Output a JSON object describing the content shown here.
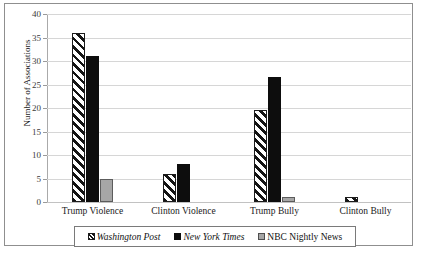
{
  "chart_data": {
    "type": "bar",
    "title": "",
    "xlabel": "",
    "ylabel": "Number of Associations",
    "ylim": [
      0,
      40
    ],
    "yticks": [
      0,
      5,
      10,
      15,
      20,
      25,
      30,
      35,
      40
    ],
    "ytick_labels": [
      "0",
      "5",
      "10",
      "15",
      "20",
      "25",
      "30",
      "35",
      "40"
    ],
    "grid": true,
    "legend_position": "bottom",
    "categories": [
      "Trump Violence",
      "Clinton Violence",
      "Trump Bully",
      "Clinton Bully"
    ],
    "series": [
      {
        "name": "Washington Post",
        "style": "diagonal-hatch",
        "color": "#ffffff",
        "italic": true,
        "values": [
          36,
          6,
          19.5,
          1
        ]
      },
      {
        "name": "New York Times",
        "style": "solid",
        "color": "#0d0d0d",
        "italic": true,
        "values": [
          31,
          8,
          26.5,
          0
        ]
      },
      {
        "name": "NBC Nightly News",
        "style": "solid",
        "color": "#a6a6a6",
        "italic": false,
        "values": [
          5,
          0,
          1,
          0
        ]
      }
    ]
  },
  "legend": {
    "items": [
      {
        "label": "Washington Post",
        "swatch": "wp"
      },
      {
        "label": "New York Times",
        "swatch": "nyt"
      },
      {
        "label": "NBC Nightly News",
        "swatch": "nbc"
      }
    ]
  }
}
